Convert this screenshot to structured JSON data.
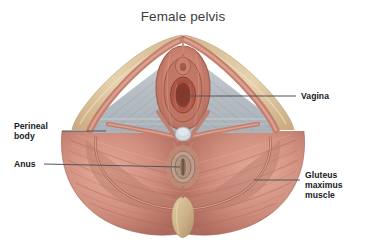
{
  "figure": {
    "title": "Female pelvis",
    "background_color": "#ffffff",
    "title_color": "#3c3c3c",
    "label_color": "#18181a",
    "leader_line_color": "#55555a"
  },
  "labels": {
    "vagina": "Vagina",
    "gluteus": "Gluteus\nmaximus\nmuscle",
    "perineal_body": "Perineal\nbody",
    "anus": "Anus"
  },
  "palette": {
    "skin_light": "#e8d4ae",
    "skin_mid": "#d8bc93",
    "skin_shadow": "#c2a47d",
    "muscle_light": "#e3a897",
    "muscle_mid": "#ca8878",
    "muscle_deep": "#b06c5f",
    "muscle_dark": "#97574c",
    "fascia_gray": "#b9bfc4",
    "fascia_gray_light": "#d5dadd",
    "mucosa_red": "#b85a4a",
    "mucosa_deep": "#8e3f33",
    "bone_tan": "#d4bc92",
    "bone_shadow": "#b49b72"
  },
  "anatomy_parts": [
    "labia-majora",
    "vaginal-opening",
    "urethral-opening",
    "perineal-membrane",
    "perineal-body",
    "anal-sphincter",
    "anus",
    "gluteus-maximus-left",
    "gluteus-maximus-right",
    "coccyx"
  ]
}
